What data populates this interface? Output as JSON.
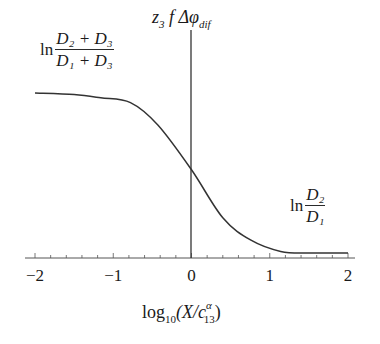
{
  "chart_data": {
    "type": "line",
    "title": "",
    "xlabel": "log10(X/c13^α)",
    "ylabel": "z3 f Δφ_dif",
    "xlim": [
      -2,
      2
    ],
    "ylim_normalized": [
      0,
      1
    ],
    "grid": false,
    "legend": null,
    "x_ticks": [
      "−2",
      "−1",
      "0",
      "1",
      "2"
    ],
    "minor_ticks_per_unit": 5,
    "annotations": {
      "upper_asymptote": "ln (D2 + D3)/(D1 + D3)",
      "lower_asymptote": "ln D2/D1",
      "vertical_line_at_x": 0
    },
    "series": [
      {
        "name": "z3 f Δφ_dif",
        "x": [
          -2.0,
          -1.5,
          -1.16,
          -0.78,
          -0.43,
          0.0,
          0.4,
          0.76,
          1.14,
          1.5,
          2.0
        ],
        "y_normalized": [
          1.0,
          0.99,
          0.97,
          0.94,
          0.8,
          0.52,
          0.22,
          0.08,
          0.01,
          0.0,
          0.0
        ]
      }
    ]
  },
  "labels": {
    "y_title_main": "z",
    "y_title_sub": "3",
    "y_title_rest": " f Δφ",
    "y_title_sub2": "dif",
    "upper": {
      "ln": "ln",
      "num": "D₂ + D₃",
      "den": "D₁ + D₃"
    },
    "lower": {
      "ln": "ln",
      "num": "D₂",
      "den": "D₁"
    },
    "xlabel_pre": "log",
    "xlabel_sub": "10",
    "xlabel_mid": "(X/c",
    "xlabel_sup": "α",
    "xlabel_sub2": "13",
    "xlabel_post": ")"
  }
}
